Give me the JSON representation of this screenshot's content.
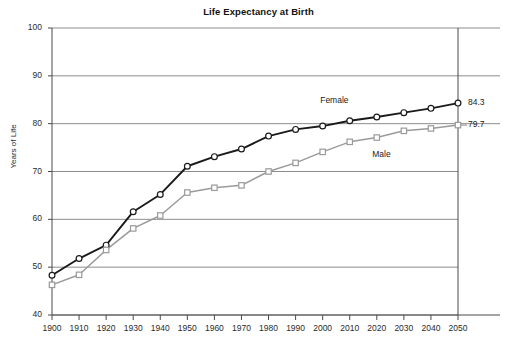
{
  "chart_data": {
    "type": "line",
    "title": "Life Expectancy at Birth",
    "xlabel": "",
    "ylabel": "Years of Life",
    "x": [
      1900,
      1910,
      1920,
      1930,
      1940,
      1950,
      1960,
      1970,
      1980,
      1990,
      2000,
      2010,
      2020,
      2030,
      2040,
      2050
    ],
    "categories": [
      "1900",
      "1910",
      "1920",
      "1930",
      "1940",
      "1950",
      "1960",
      "1970",
      "1980",
      "1990",
      "2000",
      "2010",
      "2020",
      "2030",
      "2040",
      "2050"
    ],
    "xlim": [
      1900,
      2050
    ],
    "ylim": [
      40,
      100
    ],
    "ytick_labels": [
      "100",
      "90",
      "80",
      "70",
      "60",
      "50",
      "40"
    ],
    "ytick_values": [
      100,
      90,
      80,
      70,
      60,
      50,
      40
    ],
    "grid": "horizontal",
    "legend": "inline-annotations",
    "series": [
      {
        "name": "Female",
        "marker": "circle",
        "color": "#1a1a1a",
        "end_label": "84.3",
        "values": [
          48.3,
          51.8,
          54.6,
          61.6,
          65.2,
          71.1,
          73.1,
          74.7,
          77.4,
          78.8,
          79.5,
          80.6,
          81.4,
          82.3,
          83.2,
          84.3
        ]
      },
      {
        "name": "Male",
        "marker": "square",
        "color": "#9a9a9a",
        "end_label": "79.7",
        "values": [
          46.3,
          48.4,
          53.6,
          58.1,
          60.8,
          65.6,
          66.6,
          67.1,
          70.0,
          71.8,
          74.1,
          76.2,
          77.1,
          78.5,
          79.0,
          79.7
        ]
      }
    ]
  },
  "colors": {
    "female_line": "#1a1a1a",
    "male_line": "#9a9a9a",
    "gridline": "#8c8c8c",
    "axis": "#4a4a4a",
    "background": "#ffffff",
    "text": "#1a1a1a"
  },
  "annotations": {
    "female_label": "Female",
    "male_label": "Male",
    "female_end_value": "84.3",
    "male_end_value": "79.7"
  }
}
